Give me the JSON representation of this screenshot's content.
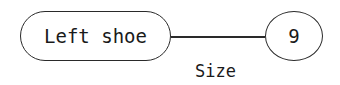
{
  "diagram": {
    "nodes": [
      {
        "id": "entity",
        "label": "Left shoe",
        "shape": "rounded-rectangle"
      },
      {
        "id": "value",
        "label": "9",
        "shape": "ellipse"
      }
    ],
    "edges": [
      {
        "from": "entity",
        "to": "value",
        "label": "Size"
      }
    ],
    "colors": {
      "stroke": "#2a2a2a",
      "background": "#ffffff"
    }
  }
}
